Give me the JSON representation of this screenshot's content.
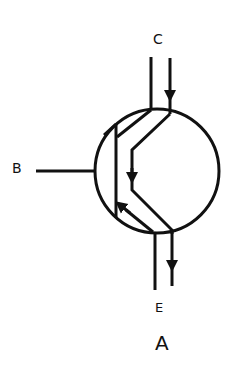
{
  "diagram": {
    "type": "transistor-symbol",
    "labels": {
      "collector": "C",
      "base": "B",
      "emitter": "E",
      "caption": "A"
    },
    "colors": {
      "stroke": "#111111",
      "background": "#ffffff"
    }
  }
}
